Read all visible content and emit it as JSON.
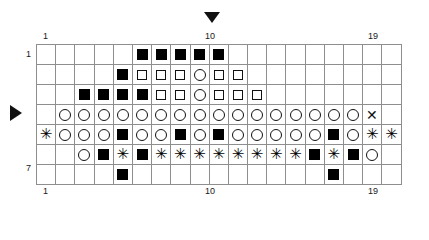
{
  "chart_data": {
    "type": "table",
    "title": "",
    "subtitle": "",
    "xlabel": "",
    "ylabel": "",
    "columns": 19,
    "rows": 7,
    "grid_on": true,
    "legend_position": "none",
    "top_tick_labels": [
      {
        "col": 1,
        "text": "1"
      },
      {
        "col": 10,
        "text": "10"
      },
      {
        "col": 19,
        "text": "19"
      }
    ],
    "bottom_tick_labels": [
      {
        "col": 1,
        "text": "1"
      },
      {
        "col": 10,
        "text": "10"
      },
      {
        "col": 19,
        "text": "19"
      }
    ],
    "left_row_labels": [
      {
        "row": 1,
        "text": "1"
      },
      {
        "row": 7,
        "text": "7"
      }
    ],
    "right_row_labels": [
      {
        "row": 1,
        "text": "1"
      },
      {
        "row": 7,
        "text": "7"
      }
    ],
    "markers": [
      {
        "name": "column-marker",
        "glyph": "triangle-down",
        "col": 10,
        "position": "top"
      },
      {
        "name": "row-marker",
        "glyph": "triangle-right",
        "row": 4,
        "position": "left"
      }
    ],
    "symbol_key": {
      "blank": "empty",
      "sq-fill": "filled-square",
      "sq-open": "open-square",
      "circ": "circle",
      "ast": "asterisk",
      "cross": "cross"
    },
    "cells": [
      [
        "blank",
        "blank",
        "blank",
        "blank",
        "blank",
        "sq-fill",
        "sq-fill",
        "sq-fill",
        "sq-fill",
        "sq-fill",
        "blank",
        "blank",
        "blank",
        "blank",
        "blank",
        "blank",
        "blank",
        "blank",
        "blank"
      ],
      [
        "blank",
        "blank",
        "blank",
        "blank",
        "sq-fill",
        "sq-open",
        "sq-open",
        "sq-open",
        "circ",
        "sq-open",
        "sq-open",
        "blank",
        "blank",
        "blank",
        "blank",
        "blank",
        "blank",
        "blank",
        "blank"
      ],
      [
        "blank",
        "blank",
        "sq-fill",
        "sq-fill",
        "sq-fill",
        "sq-fill",
        "sq-open",
        "sq-open",
        "circ",
        "sq-open",
        "sq-open",
        "sq-open",
        "blank",
        "blank",
        "blank",
        "blank",
        "blank",
        "blank",
        "blank"
      ],
      [
        "blank",
        "circ",
        "circ",
        "circ",
        "circ",
        "circ",
        "circ",
        "circ",
        "circ",
        "circ",
        "circ",
        "circ",
        "circ",
        "circ",
        "circ",
        "circ",
        "circ",
        "cross",
        "blank"
      ],
      [
        "ast",
        "circ",
        "circ",
        "circ",
        "sq-fill",
        "circ",
        "circ",
        "sq-fill",
        "circ",
        "sq-fill",
        "circ",
        "circ",
        "circ",
        "circ",
        "circ",
        "sq-fill",
        "circ",
        "ast",
        "ast"
      ],
      [
        "blank",
        "blank",
        "circ",
        "sq-fill",
        "ast",
        "sq-fill",
        "ast",
        "ast",
        "ast",
        "ast",
        "ast",
        "ast",
        "ast",
        "ast",
        "sq-fill",
        "ast",
        "sq-fill",
        "circ",
        "blank"
      ],
      [
        "blank",
        "blank",
        "blank",
        "blank",
        "sq-fill",
        "blank",
        "blank",
        "blank",
        "blank",
        "blank",
        "blank",
        "blank",
        "blank",
        "blank",
        "blank",
        "sq-fill",
        "blank",
        "blank",
        "blank"
      ]
    ],
    "heavy_column_separators": [
      6,
      11,
      16
    ],
    "heavy_row_separators": [
      4,
      6
    ]
  },
  "glyphs": {
    "asterisk": "✳",
    "cross": "✕",
    "triangle_down": "▼",
    "triangle_right": "▶"
  }
}
